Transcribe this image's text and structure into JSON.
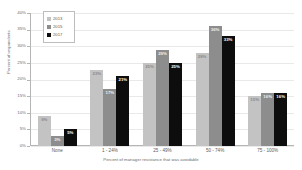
{
  "chart_data": {
    "type": "bar",
    "title": "",
    "xlabel": "Percent of manager resistance that was avoidable",
    "ylabel": "Percent of respondents",
    "categories": [
      "None",
      "1 - 24%",
      "25 - 49%",
      "50 - 74%",
      "75 - 100%"
    ],
    "series": [
      {
        "name": "2013",
        "color": "#c3c3c3",
        "values": [
          9,
          23,
          25,
          28,
          15
        ],
        "labels": [
          "9%",
          "23%",
          "25%",
          "28%",
          "15%"
        ]
      },
      {
        "name": "2015",
        "color": "#8d8d8d",
        "values": [
          3,
          17,
          29,
          36,
          16
        ],
        "labels": [
          "3%",
          "17%",
          "29%",
          "36%",
          "16%"
        ]
      },
      {
        "name": "2017",
        "color": "#0d0d0d",
        "values": [
          5,
          21,
          25,
          33,
          16
        ],
        "labels": [
          "5%",
          "21%",
          "25%",
          "33%",
          "16%"
        ]
      }
    ],
    "ylim": [
      0,
      40
    ],
    "yticks": [
      "0%",
      "5%",
      "10%",
      "15%",
      "20%",
      "25%",
      "30%",
      "35%",
      "40%"
    ],
    "ytick_values": [
      0,
      5,
      10,
      15,
      20,
      25,
      30,
      35,
      40
    ],
    "grid": true,
    "legend_position": "top-left"
  }
}
